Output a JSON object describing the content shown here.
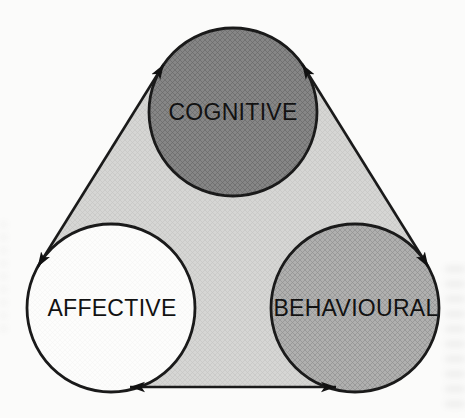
{
  "diagram": {
    "type": "triangle-cycle",
    "background_color": "#fbfbfa",
    "triangle_fill": "#d6d6d4",
    "line_color": "#1a1a1a",
    "arrow_color": "#111111",
    "nodes": [
      {
        "id": "cognitive",
        "label": "COGNITIVE",
        "fill": "#868686",
        "outline": "#1a1a1a",
        "text_color": "#121212"
      },
      {
        "id": "affective",
        "label": "AFFECTIVE",
        "fill": "#fdfdfc",
        "outline": "#1a1a1a",
        "text_color": "#121212"
      },
      {
        "id": "behavioural",
        "label": "BEHAVIOURAL",
        "fill": "#b0b0af",
        "outline": "#1a1a1a",
        "text_color": "#121212"
      }
    ],
    "edges": [
      {
        "from": "cognitive",
        "to": "affective",
        "arrows": "both"
      },
      {
        "from": "cognitive",
        "to": "behavioural",
        "arrows": "both"
      },
      {
        "from": "affective",
        "to": "behavioural",
        "arrows": "both"
      }
    ]
  }
}
